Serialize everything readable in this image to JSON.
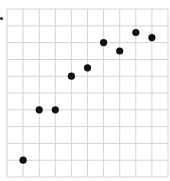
{
  "chart_data": {
    "type": "scatter",
    "title": "",
    "xlabel": "",
    "ylabel": "",
    "xlim": [
      0,
      10
    ],
    "ylim": [
      0,
      10
    ],
    "grid": true,
    "grid_divisions": {
      "x": 10,
      "y": 10
    },
    "legend": null,
    "series": [
      {
        "name": "points",
        "color": "#111111",
        "points": [
          {
            "x": 1,
            "y": 1
          },
          {
            "x": 2,
            "y": 4
          },
          {
            "x": 3,
            "y": 4
          },
          {
            "x": 4,
            "y": 6
          },
          {
            "x": 5,
            "y": 6.5
          },
          {
            "x": 6,
            "y": 8
          },
          {
            "x": 7,
            "y": 7.5
          },
          {
            "x": 8,
            "y": 8.6
          },
          {
            "x": 9,
            "y": 8.3
          }
        ]
      }
    ]
  },
  "colors": {
    "grid": "#d4d4d4",
    "marker": "#111111",
    "background": "#ffffff"
  }
}
